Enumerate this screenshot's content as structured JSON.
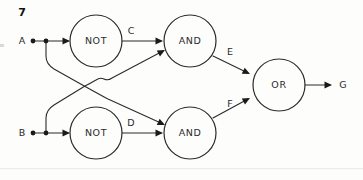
{
  "figure": {
    "number": "7",
    "number_x": 22,
    "number_y": 13
  },
  "colors": {
    "ink": "#2b2b2b",
    "ink_dark": "#1a1a1a",
    "background": "#fdfdfc"
  },
  "inputs": [
    {
      "id": "input-a",
      "label": "A",
      "x": 22,
      "y": 41,
      "dot1_x": 33,
      "dot2_x": 46,
      "dot_y": 41
    },
    {
      "id": "input-b",
      "label": "B",
      "x": 22,
      "y": 133,
      "dot1_x": 33,
      "dot2_x": 46,
      "dot_y": 133
    }
  ],
  "outputs": [
    {
      "id": "output-g",
      "label": "G",
      "x": 343,
      "y": 85
    }
  ],
  "gates": [
    {
      "id": "gate-not-top",
      "label": "NOT",
      "cx": 96,
      "cy": 41,
      "r": 26
    },
    {
      "id": "gate-and-top",
      "label": "AND",
      "cx": 190,
      "cy": 41,
      "r": 26
    },
    {
      "id": "gate-not-bottom",
      "label": "NOT",
      "cx": 96,
      "cy": 133,
      "r": 26
    },
    {
      "id": "gate-and-bottom",
      "label": "AND",
      "cx": 190,
      "cy": 133,
      "r": 26
    },
    {
      "id": "gate-or",
      "label": "OR",
      "cx": 279,
      "cy": 85,
      "r": 26
    }
  ],
  "signals": [
    {
      "id": "signal-c",
      "label": "C",
      "x": 131,
      "y": 31
    },
    {
      "id": "signal-e",
      "label": "E",
      "x": 230,
      "y": 52
    },
    {
      "id": "signal-d",
      "label": "D",
      "x": 131,
      "y": 123
    },
    {
      "id": "signal-f",
      "label": "F",
      "x": 230,
      "y": 104
    }
  ],
  "wires": [
    {
      "id": "wire-a-to-not-top",
      "d": "M 33 41 L 68 41"
    },
    {
      "id": "wire-not-top-to-and-top",
      "d": "M 122 41 L 161 41"
    },
    {
      "id": "wire-b-to-not-bottom",
      "d": "M 33 133 L 68 133"
    },
    {
      "id": "wire-not-bottom-to-and-bottom",
      "d": "M 122 133 L 161 133"
    },
    {
      "id": "wire-a-branch-to-and-bottom",
      "d": "M 46 41 L 46 56 Q 46 64 54 69 L 86 87 L 106 98 L 108 99 L 163 124"
    },
    {
      "id": "wire-b-branch-to-and-top",
      "d": "M 46 133 L 46 118 Q 46 110 54 105 L 85 86 Q 91 83 96 80 Q 100 77 104 79 Q 108 81 112 78 L 163 51"
    },
    {
      "id": "wire-and-top-to-or",
      "d": "M 213 56 L 248 73"
    },
    {
      "id": "wire-and-bottom-to-or",
      "d": "M 213 118 L 248 99"
    },
    {
      "id": "wire-or-to-g",
      "d": "M 305 85 L 330 85"
    }
  ],
  "arrows": [
    {
      "id": "arrow-into-not-top",
      "tip_x": 70,
      "tip_y": 41,
      "angle": 0
    },
    {
      "id": "arrow-into-and-top-c",
      "tip_x": 163,
      "tip_y": 41,
      "angle": 0
    },
    {
      "id": "arrow-into-not-bottom",
      "tip_x": 70,
      "tip_y": 133,
      "angle": 0
    },
    {
      "id": "arrow-into-and-bottom-d",
      "tip_x": 163,
      "tip_y": 133,
      "angle": 0
    },
    {
      "id": "arrow-into-and-top-b",
      "tip_x": 165,
      "tip_y": 50,
      "angle": -28
    },
    {
      "id": "arrow-into-and-bottom-a",
      "tip_x": 165,
      "tip_y": 125,
      "angle": 25
    },
    {
      "id": "arrow-into-or-e",
      "tip_x": 250,
      "tip_y": 74,
      "angle": 26
    },
    {
      "id": "arrow-into-or-f",
      "tip_x": 250,
      "tip_y": 98,
      "angle": -28
    },
    {
      "id": "arrow-to-g",
      "tip_x": 332,
      "tip_y": 85,
      "angle": 0
    }
  ],
  "junctions": [
    {
      "id": "junction-a-1",
      "cx": 33,
      "cy": 41,
      "r": 2.4
    },
    {
      "id": "junction-a-2",
      "cx": 46,
      "cy": 41,
      "r": 2.4
    },
    {
      "id": "junction-b-1",
      "cx": 33,
      "cy": 133,
      "r": 2.4
    },
    {
      "id": "junction-b-2",
      "cx": 46,
      "cy": 133,
      "r": 2.4
    }
  ]
}
